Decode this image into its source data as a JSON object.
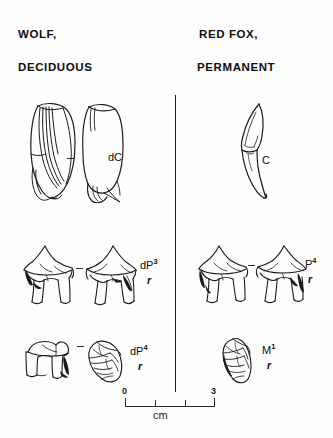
{
  "figure": {
    "background_color": "#fefefe",
    "ink_color": "#1a1a1a"
  },
  "headers": {
    "left_line1": "WOLF,",
    "left_line2": "DECIDUOUS",
    "right_line1": "RED FOX,",
    "right_line2": "PERMANENT"
  },
  "rows": [
    {
      "left": {
        "label_base": "dC",
        "label_sup": "",
        "sublabel": "",
        "views": 2,
        "specimen": "wolf-deciduous-canine"
      },
      "right": {
        "label_base": "C",
        "label_sup": "",
        "sublabel": "",
        "views": 1,
        "specimen": "red-fox-permanent-canine"
      }
    },
    {
      "left": {
        "label_base": "dP",
        "label_sup": "3",
        "sublabel": "r",
        "views": 2,
        "specimen": "wolf-deciduous-third-premolar"
      },
      "right": {
        "label_base": "P",
        "label_sup": "4",
        "sublabel": "r",
        "views": 2,
        "specimen": "red-fox-permanent-fourth-premolar"
      }
    },
    {
      "left": {
        "label_base": "dP",
        "label_sup": "4",
        "sublabel": "r",
        "views": 2,
        "specimen": "wolf-deciduous-fourth-premolar"
      },
      "right": {
        "label_base": "M",
        "label_sup": "1",
        "sublabel": "r",
        "views": 1,
        "specimen": "red-fox-permanent-first-molar"
      }
    }
  ],
  "scale_bar": {
    "start_label": "0",
    "end_label": "3",
    "unit_label": "cm",
    "ticks": [
      "0",
      "1",
      "2",
      "3"
    ]
  }
}
